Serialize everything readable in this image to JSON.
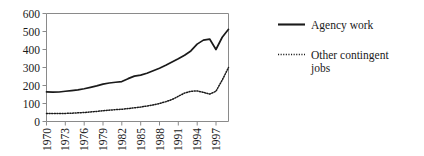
{
  "chart_data": {
    "type": "line",
    "title": "",
    "xlabel": "",
    "ylabel": "",
    "ylim": [
      0,
      600
    ],
    "yticks": [
      0,
      100,
      200,
      300,
      400,
      500,
      600
    ],
    "ytick_labels": [
      "0",
      "100",
      "200",
      "300",
      "400",
      "500",
      "600"
    ],
    "xlim": [
      1970,
      1999
    ],
    "xticks": [
      1970,
      1973,
      1976,
      1979,
      1982,
      1985,
      1988,
      1991,
      1994,
      1997
    ],
    "xtick_labels": [
      "1970",
      "1973",
      "1976",
      "1979",
      "1982",
      "1985",
      "1988",
      "1991",
      "1994",
      "1997"
    ],
    "xtick_rotation": 90,
    "grid": false,
    "legend_position": "right",
    "x": [
      1970,
      1971,
      1972,
      1973,
      1974,
      1975,
      1976,
      1977,
      1978,
      1979,
      1980,
      1981,
      1982,
      1983,
      1984,
      1985,
      1986,
      1987,
      1988,
      1989,
      1990,
      1991,
      1992,
      1993,
      1994,
      1995,
      1996,
      1997,
      1998,
      1999
    ],
    "series": [
      {
        "name": "Agency work",
        "style": "solid",
        "color": "#1a1a1a",
        "values": [
          165,
          163,
          164,
          168,
          172,
          176,
          182,
          190,
          198,
          208,
          214,
          218,
          222,
          238,
          252,
          258,
          268,
          282,
          296,
          312,
          330,
          348,
          368,
          392,
          430,
          452,
          458,
          400,
          468,
          512
        ]
      },
      {
        "name": "Other contingent jobs",
        "style": "dotted",
        "color": "#1a1a1a",
        "values": [
          45,
          44,
          44,
          45,
          46,
          48,
          50,
          53,
          56,
          60,
          63,
          66,
          68,
          72,
          76,
          80,
          86,
          92,
          100,
          110,
          122,
          140,
          158,
          168,
          170,
          162,
          152,
          168,
          230,
          300
        ]
      }
    ],
    "legend": [
      {
        "label": "Agency work",
        "style": "solid"
      },
      {
        "label": "Other contingent jobs",
        "style": "dotted"
      }
    ]
  },
  "legend_text": {
    "agency_work": "Agency work",
    "other_contingent_line1": "Other contingent",
    "other_contingent_line2": "jobs"
  }
}
